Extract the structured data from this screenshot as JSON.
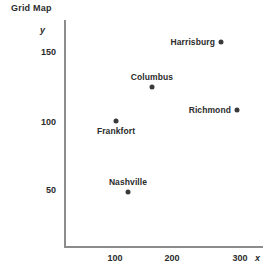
{
  "chart_data": {
    "type": "scatter",
    "title": "Grid Map",
    "xlabel": "x",
    "ylabel": "y",
    "xlim": [
      0,
      330
    ],
    "ylim": [
      0,
      180
    ],
    "grid": false,
    "legend": "none",
    "xticks": [
      {
        "value": 100,
        "label": "100",
        "px": 115
      },
      {
        "value": 200,
        "label": "200",
        "px": 172
      },
      {
        "value": 300,
        "label": "300",
        "px": 240
      }
    ],
    "yticks": [
      {
        "value": 150,
        "label": "150",
        "px": 52
      },
      {
        "value": 100,
        "label": "100",
        "px": 122
      },
      {
        "value": 50,
        "label": "50",
        "px": 190
      }
    ],
    "points": [
      {
        "name": "Harrisburg",
        "x": 275,
        "y": 157,
        "px": 221,
        "py": 42,
        "label_pos": "left"
      },
      {
        "name": "Columbus",
        "x": 165,
        "y": 125,
        "px": 152,
        "py": 87,
        "label_pos": "above"
      },
      {
        "name": "Richmond",
        "x": 300,
        "y": 107,
        "px": 237,
        "py": 110,
        "label_pos": "left"
      },
      {
        "name": "Frankfort",
        "x": 100,
        "y": 100,
        "px": 116,
        "py": 121,
        "label_pos": "below"
      },
      {
        "name": "Nashville",
        "x": 140,
        "y": 48,
        "px": 128,
        "py": 192,
        "label_pos": "above"
      }
    ]
  },
  "colors": {
    "marker": "#3a3a3a",
    "axis": "#8c8c8c",
    "text": "#2b2b2b",
    "background": "#ffffff"
  }
}
